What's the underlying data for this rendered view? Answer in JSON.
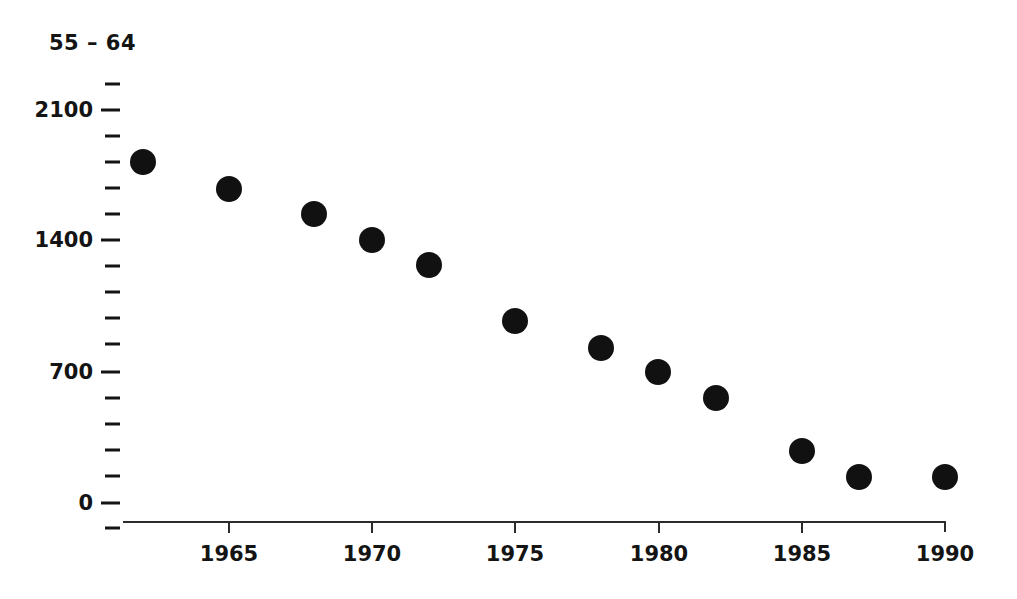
{
  "chart_data": {
    "type": "scatter",
    "title": "55 – 64",
    "xlabel": "",
    "ylabel": "",
    "x": [
      1962,
      1965,
      1968,
      1970,
      1972,
      1975,
      1978,
      1980,
      1982,
      1985,
      1987,
      1990
    ],
    "values": [
      1820,
      1680,
      1545,
      1405,
      1270,
      970,
      830,
      700,
      560,
      280,
      140,
      140
    ],
    "series": [
      {
        "name": "55 – 64",
        "points": [
          {
            "x": 1962,
            "y": 1820
          },
          {
            "x": 1965,
            "y": 1680
          },
          {
            "x": 1968,
            "y": 1545
          },
          {
            "x": 1970,
            "y": 1405
          },
          {
            "x": 1972,
            "y": 1270
          },
          {
            "x": 1975,
            "y": 970
          },
          {
            "x": 1978,
            "y": 830
          },
          {
            "x": 1980,
            "y": 700
          },
          {
            "x": 1982,
            "y": 560
          },
          {
            "x": 1985,
            "y": 280
          },
          {
            "x": 1987,
            "y": 140
          },
          {
            "x": 1990,
            "y": 140
          }
        ]
      }
    ],
    "xlim": [
      1961.2,
      1990.6
    ],
    "ylim": [
      0,
      2380
    ],
    "x_ticks": [
      1965,
      1970,
      1975,
      1980,
      1985,
      1990
    ],
    "x_tick_labels": [
      "1965",
      "1970",
      "1975",
      "1980",
      "1985",
      "1990"
    ],
    "y_major_ticks": [
      0,
      700,
      1400,
      2100
    ],
    "y_major_tick_labels": [
      "0",
      "700",
      "1400",
      "2100"
    ],
    "y_minor_ticks": [
      140,
      280,
      420,
      560,
      840,
      980,
      1120,
      1260,
      1540,
      1680,
      1820,
      1960,
      2240
    ],
    "grid": false,
    "legend": "none",
    "marker_color": "#111111",
    "axis_color": "#2b2b2b",
    "text_color": "#141414"
  }
}
